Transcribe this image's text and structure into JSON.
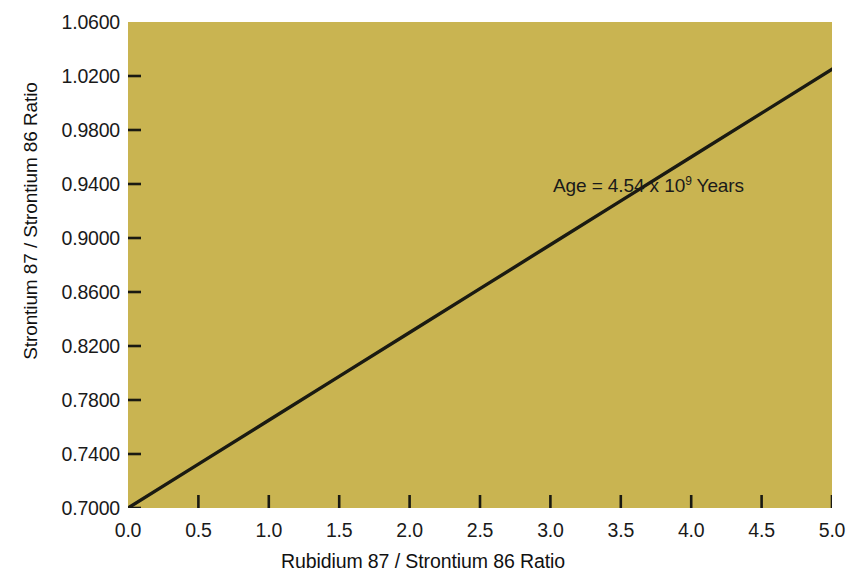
{
  "chart_data": {
    "type": "line",
    "title": "",
    "xlabel": "Rubidium 87 / Strontium 86 Ratio",
    "ylabel": "Strontium 87 / Strontium 86 Ratio",
    "xlim": [
      0.0,
      5.0
    ],
    "ylim": [
      0.7,
      1.06
    ],
    "grid": false,
    "legend": "none",
    "plot_background_color": "#c9b451",
    "line_color": "#1a1a12",
    "xticks": [
      0.0,
      0.5,
      1.0,
      1.5,
      2.0,
      2.5,
      3.0,
      3.5,
      4.0,
      4.5,
      5.0
    ],
    "xtick_labels": [
      "0.0",
      "0.5",
      "1.0",
      "1.5",
      "2.0",
      "2.5",
      "3.0",
      "3.5",
      "4.0",
      "4.5",
      "5.0"
    ],
    "yticks": [
      0.7,
      0.74,
      0.78,
      0.82,
      0.86,
      0.9,
      0.94,
      0.98,
      1.02,
      1.06
    ],
    "ytick_labels": [
      "0.7000",
      "0.7400",
      "0.7800",
      "0.8200",
      "0.8600",
      "0.9000",
      "0.9400",
      "0.9800",
      "1.0200",
      "1.0600"
    ],
    "series": [
      {
        "name": "isochron",
        "x": [
          0.0,
          0.5,
          1.0,
          1.5,
          2.0,
          2.5,
          3.0,
          3.5,
          4.0,
          4.5,
          5.0
        ],
        "values": [
          0.7,
          0.7325,
          0.765,
          0.7975,
          0.83,
          0.8625,
          0.895,
          0.9275,
          0.96,
          0.9925,
          1.025
        ]
      }
    ],
    "annotations": [
      {
        "name": "age-annotation",
        "text_prefix": "Age = 4.54 x 10",
        "text_exponent": "9",
        "text_suffix": " Years",
        "full_text": "Age = 4.54 x 10⁹ Years"
      }
    ]
  },
  "axes": {
    "y_title": "Strontium 87 / Strontium 86 Ratio",
    "x_title": "Rubidium 87 / Strontium 86 Ratio"
  }
}
